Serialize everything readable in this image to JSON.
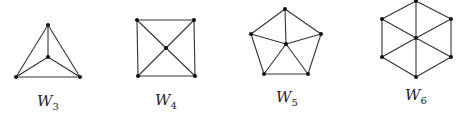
{
  "figure": {
    "graphs": [
      {
        "name": "W3",
        "label_base": "W",
        "label_sub": "3",
        "label_pos": [
          48,
          92
        ],
        "center": [
          48,
          57
        ],
        "rim": [
          [
            48,
            25
          ],
          [
            80,
            77
          ],
          [
            16,
            77
          ]
        ]
      },
      {
        "name": "W4",
        "label_base": "W",
        "label_sub": "4",
        "label_pos": [
          166,
          91
        ],
        "center": [
          166,
          48
        ],
        "rim": [
          [
            137,
            20
          ],
          [
            194,
            20
          ],
          [
            195,
            76
          ],
          [
            138,
            76
          ]
        ]
      },
      {
        "name": "W5",
        "label_base": "W",
        "label_sub": "5",
        "label_pos": [
          287,
          88
        ],
        "center": [
          286,
          44
        ],
        "rim": [
          [
            285,
            9
          ],
          [
            321,
            34
          ],
          [
            308,
            74
          ],
          [
            264,
            74
          ],
          [
            251,
            34
          ]
        ]
      },
      {
        "name": "W6",
        "label_base": "W",
        "label_sub": "6",
        "label_pos": [
          416,
          86
        ],
        "center": [
          416,
          38
        ],
        "rim": [
          [
            416,
            1
          ],
          [
            451,
            19
          ],
          [
            451,
            57
          ],
          [
            416,
            77
          ],
          [
            382,
            57
          ],
          [
            382,
            19
          ]
        ]
      }
    ],
    "colors": {
      "edge": "#333333",
      "vertex": "#111111",
      "background": "#ffffff"
    }
  }
}
